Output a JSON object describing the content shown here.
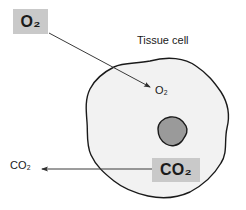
{
  "figure": {
    "type": "biology-diagram",
    "width": 246,
    "height": 210,
    "background_color": "#ffffff"
  },
  "labels": {
    "o2_external": "O₂",
    "o2_external_text": "O2",
    "tissue_cell": "Tissue cell",
    "o2_internal": "O₂",
    "o2_internal_text": "O2",
    "co2_internal": "CO₂",
    "co2_internal_text": "CO2",
    "co2_external": "CO₂",
    "co2_external_text": "CO2"
  },
  "colors": {
    "highlight_box": "#c9c9c9",
    "cell_fill": "#f2f2f2",
    "cell_outline": "#1a1a1a",
    "nucleus_fill": "#9a9a9a",
    "nucleus_outline": "#1a1a1a",
    "text": "#1a1a1a",
    "arrow": "#404040"
  },
  "shapes": {
    "cell": {
      "name": "tissue-cell-membrane",
      "description": "irregular rounded amoeboid cell outline"
    },
    "nucleus": {
      "name": "cell-nucleus",
      "description": "small irregular gray blob inside the cell"
    }
  },
  "arrows": [
    {
      "name": "o2-uptake-arrow",
      "label": "O2 into cell",
      "from": [
        49,
        33
      ],
      "to": [
        152,
        88
      ],
      "direction": "into-cell"
    },
    {
      "name": "co2-release-arrow",
      "label": "CO2 out of cell",
      "from": [
        152,
        169
      ],
      "to": [
        40,
        169
      ],
      "direction": "out-of-cell"
    }
  ]
}
